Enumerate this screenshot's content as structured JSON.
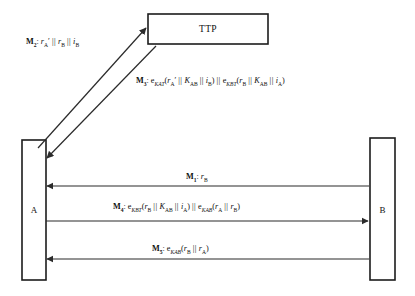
{
  "diagram": {
    "nodes": [
      {
        "id": "ttp",
        "label": "TTP",
        "role": "trusted-third-party"
      },
      {
        "id": "a",
        "label": "A",
        "role": "initiator"
      },
      {
        "id": "b",
        "label": "B",
        "role": "responder"
      }
    ],
    "messages": [
      {
        "id": "m1",
        "tag": "M",
        "index": "1",
        "from": "B",
        "to": "A",
        "direction": "right-to-left",
        "payload_plain": "r_B",
        "payload_html": "<span class=\"it\">r</span><sub>B</sub>"
      },
      {
        "id": "m2",
        "tag": "M",
        "index": "2",
        "from": "A",
        "to": "TTP",
        "direction": "up-right",
        "payload_plain": "r'_A || r_B || i_B",
        "payload_html": "<span class=\"it\">r</span><sub>A</sub>&prime;<span class=\"bar\">&thinsp;||&thinsp;</span><span class=\"it\">r</span><sub>B</sub><span class=\"bar\">&thinsp;||&thinsp;</span><span class=\"it\">i</span><sub>B</sub>"
      },
      {
        "id": "m3",
        "tag": "M",
        "index": "3",
        "from": "TTP",
        "to": "A",
        "direction": "down-left",
        "payload_plain": "e_KAT(r'_A || K_AB || i_B) || e_KBT(r_B || K_AB || i_A)",
        "payload_html": "e<sub><span class=\"it\">KAT</span></sub>(<span class=\"it\">r</span><sub>A</sub>&prime;<span class=\"bar\">&thinsp;||&thinsp;</span><span class=\"it\">K</span><sub>AB</sub><span class=\"bar\">&thinsp;||&thinsp;</span><span class=\"it\">i</span><sub>B</sub>)<span class=\"bar\">&thinsp;||&thinsp;</span>e<sub><span class=\"it\">KBT</span></sub>(<span class=\"it\">r</span><sub>B</sub><span class=\"bar\">&thinsp;||&thinsp;</span><span class=\"it\">K</span><sub>AB</sub><span class=\"bar\">&thinsp;||&thinsp;</span><span class=\"it\">i</span><sub>A</sub>)"
      },
      {
        "id": "m4",
        "tag": "M",
        "index": "4",
        "from": "A",
        "to": "B",
        "direction": "left-to-right",
        "payload_plain": "e_KBT(r_B || K_AB || i_A) || e_KAB(r_A || r_B)",
        "payload_html": "e<sub><span class=\"it\">KBT</span></sub>(<span class=\"it\">r</span><sub>B</sub><span class=\"bar\">&thinsp;||&thinsp;</span><span class=\"it\">K</span><sub>AB</sub><span class=\"bar\">&thinsp;||&thinsp;</span><span class=\"it\">i</span><sub>A</sub>)<span class=\"bar\">&thinsp;||&thinsp;</span>e<sub><span class=\"it\">KAB</span></sub>(<span class=\"it\">r</span><sub>A</sub><span class=\"bar\">&thinsp;||&thinsp;</span><span class=\"it\">r</span><sub>B</sub>)"
      },
      {
        "id": "m5",
        "tag": "M",
        "index": "5",
        "from": "B",
        "to": "A",
        "direction": "right-to-left",
        "payload_plain": "e_KAB(r_B || r_A)",
        "payload_html": "e<sub><span class=\"it\">KAB</span></sub>(<span class=\"it\">r</span><sub>B</sub><span class=\"bar\">&thinsp;||&thinsp;</span><span class=\"it\">r</span><sub>A</sub>)"
      }
    ],
    "colors": {
      "stroke": "#1c1c1c",
      "line": "#2b2b2b",
      "background": "#ffffff",
      "text": "#111111"
    }
  }
}
